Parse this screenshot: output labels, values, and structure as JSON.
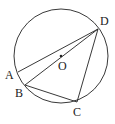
{
  "diagram": {
    "type": "circle-geometry",
    "circle": {
      "center_label": "O"
    },
    "points": [
      {
        "id": "A",
        "label": "A"
      },
      {
        "id": "B",
        "label": "B"
      },
      {
        "id": "C",
        "label": "C"
      },
      {
        "id": "D",
        "label": "D"
      }
    ],
    "segments": [
      [
        "A",
        "D"
      ],
      [
        "B",
        "D"
      ],
      [
        "B",
        "C"
      ],
      [
        "C",
        "D"
      ]
    ]
  },
  "colors": {
    "stroke": "#222222",
    "background": "#ffffff"
  }
}
